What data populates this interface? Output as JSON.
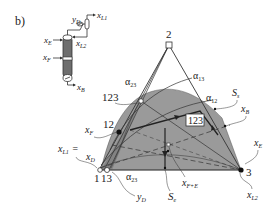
{
  "panel_label": "b)",
  "column": {
    "x_E": "x",
    "x_E_sub": "E",
    "x_F": "x",
    "x_F_sub": "F",
    "x_B": "x",
    "x_B_sub": "B",
    "y_D": "y",
    "y_D_sub": "D",
    "x_L1": "x",
    "x_L1_sub": "L1",
    "x_L2": "x",
    "x_L2_sub": "L2"
  },
  "triangle": {
    "vertex_1": "1",
    "vertex_2": "2",
    "vertex_3": "3",
    "point_13": "13",
    "point_12": "12",
    "point_123": "123",
    "region_label": "123"
  },
  "boundaries": {
    "alpha_23": "α",
    "alpha_23_sub": "23",
    "alpha_13": "α",
    "alpha_13_sub": "13",
    "alpha_12": "α",
    "alpha_12_sub": "12",
    "alpha_23_bottom": "α",
    "alpha_23_bottom_sub": "23"
  },
  "annotations": {
    "S_s": "S",
    "S_s_sub": "s",
    "S_e": "S",
    "S_e_sub": "e",
    "x_B": "x",
    "x_B_sub": "B",
    "x_E": "x",
    "x_E_sub": "E",
    "x_F": "x",
    "x_F_sub": "F",
    "x_L1": "x",
    "x_L1_sub": "L1",
    "eq": "=",
    "x_D": "x",
    "x_D_sub": "D",
    "x_L2": "x",
    "x_L2_sub": "L2",
    "y_D": "y",
    "y_D_sub": "D",
    "x_FE": "x",
    "x_FE_sub": "F+E"
  },
  "colors": {
    "region_fill": "#9a9a9a",
    "region_dark": "#7d7d7d",
    "line": "#333333",
    "column_fill": "#6e6e6e"
  }
}
